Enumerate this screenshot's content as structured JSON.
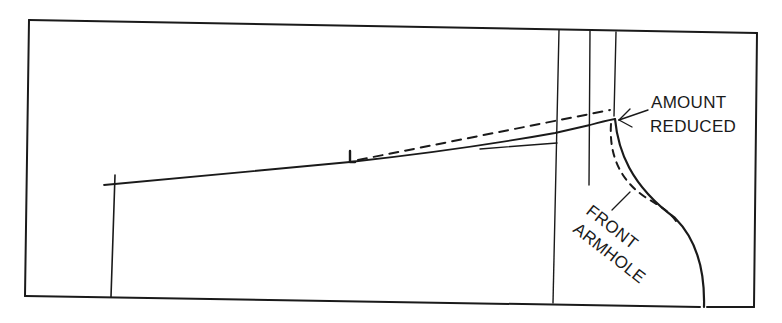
{
  "diagram": {
    "labels": {
      "amount_reduced_line1": "AMOUNT",
      "amount_reduced_line2": "REDUCED",
      "front_armhole_line1": "FRONT",
      "front_armhole_line2": "ARMHOLE"
    },
    "colors": {
      "ink": "#1a1a1a",
      "background": "#ffffff"
    },
    "elements": [
      "outer-frame",
      "center-front-line",
      "shoulder-line",
      "reduced-shoulder-dashed-line",
      "armhole-curve",
      "reduced-armhole-dashed-curve",
      "vertical-guide-lines",
      "amount-reduced-arrow",
      "front-armhole-leader"
    ]
  }
}
